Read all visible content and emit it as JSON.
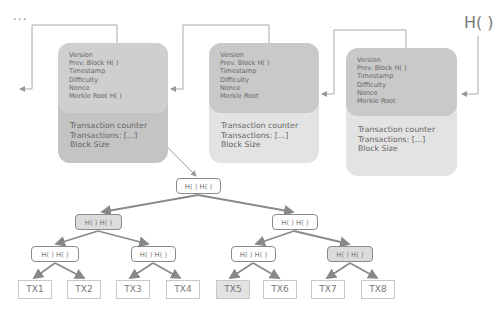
{
  "diagram": {
    "ellipsis": "...",
    "hash_label": "H( )",
    "blocks": [
      {
        "header": [
          "Version",
          "Prev. Block H( )",
          "Timestamp",
          "Difficulty",
          "Nonce",
          "Merkle Root H( )"
        ],
        "body": [
          "Transaction counter",
          "Transactions: [...]",
          "Block Size"
        ],
        "header_color": "#cfcfcf",
        "body_color": "#c4c4c4"
      },
      {
        "header": [
          "Version",
          "Prev. Block H( )",
          "Timestamp",
          "Difficulty",
          "Nonce",
          "Merkle Root"
        ],
        "body": [
          "Transaction counter",
          "Transactions: [...]",
          "Block Size"
        ],
        "header_color": "#c9c9c9",
        "body_color": "#e3e3e3"
      },
      {
        "header": [
          "Version",
          "Prev. Block H( )",
          "Timestamp",
          "Difficulty",
          "Nonce",
          "Merkle Root"
        ],
        "body": [
          "Transaction counter",
          "Transactions: [...]",
          "Block Size"
        ],
        "header_color": "#c9c9c9",
        "body_color": "#e3e3e3"
      }
    ],
    "merkle_tree": {
      "root": "H( ) H( )",
      "level2": [
        {
          "label": "H( ) H( )",
          "highlighted": true
        },
        {
          "label": "H( ) H( )",
          "highlighted": false
        }
      ],
      "level3": [
        {
          "label": "H( ) H( )",
          "highlighted": false
        },
        {
          "label": "H( ) H( )",
          "highlighted": false
        },
        {
          "label": "H( ) H( )",
          "highlighted": false
        },
        {
          "label": "H( ) H( )",
          "highlighted": true
        }
      ],
      "leaves": [
        {
          "label": "TX1",
          "highlighted": false
        },
        {
          "label": "TX2",
          "highlighted": false
        },
        {
          "label": "TX3",
          "highlighted": false
        },
        {
          "label": "TX4",
          "highlighted": false
        },
        {
          "label": "TX5",
          "highlighted": true
        },
        {
          "label": "TX6",
          "highlighted": false
        },
        {
          "label": "TX7",
          "highlighted": false
        },
        {
          "label": "TX8",
          "highlighted": false
        }
      ]
    }
  }
}
